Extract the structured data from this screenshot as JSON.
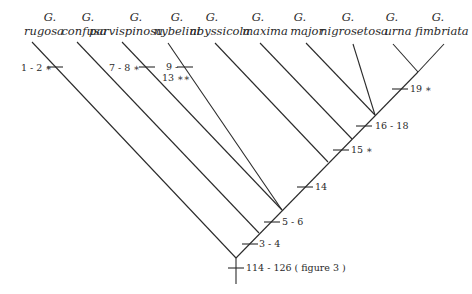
{
  "diagram": {
    "type": "cladogram",
    "taxa": [
      {
        "genus": "G.",
        "species": "rugosa",
        "label_x": 44,
        "tip": [
          32,
          42
        ],
        "joins": [
          236,
          258
        ]
      },
      {
        "genus": "G.",
        "species": "confusa",
        "label_x": 84,
        "tip": [
          77,
          42
        ],
        "joins": [
          259,
          233
        ]
      },
      {
        "genus": "G.",
        "species": "parvispinosa",
        "label_x": 126,
        "tip": [
          122,
          42
        ],
        "joins": [
          282,
          210
        ]
      },
      {
        "genus": "G.",
        "species": "nybelini",
        "label_x": 177,
        "tip": [
          168,
          43
        ],
        "joins": [
          282,
          210
        ]
      },
      {
        "genus": "G.",
        "species": "abyssicola",
        "label_x": 221,
        "tip": [
          215,
          43
        ],
        "joins": [
          328,
          162
        ]
      },
      {
        "genus": "G.",
        "species": "maxima",
        "label_x": 265,
        "tip": [
          260,
          43
        ],
        "joins": [
          352,
          139
        ]
      },
      {
        "genus": "G.",
        "species": "major",
        "label_x": 308,
        "tip": [
          306,
          43
        ],
        "joins": [
          375,
          115
        ]
      },
      {
        "genus": "G.",
        "species": "nigrosetosa",
        "label_x": 357,
        "tip": [
          353,
          44
        ],
        "joins": [
          375,
          115
        ]
      },
      {
        "genus": "G.",
        "species": "urna",
        "label_x": 398,
        "tip": [
          393,
          44
        ],
        "joins": [
          418,
          72
        ]
      },
      {
        "genus": "G.",
        "species": "fimbriata",
        "label_x": 444,
        "tip": [
          444,
          44
        ],
        "joins": [
          418,
          72
        ]
      }
    ],
    "trunk": {
      "from": [
        236,
        258
      ],
      "to": [
        418,
        72
      ]
    },
    "root_stem": {
      "from": [
        236,
        258
      ],
      "to": [
        236,
        283
      ]
    },
    "characters": [
      {
        "id": "c-1-2",
        "label": "1 - 2 ∗",
        "tick_x": 55,
        "tick_y": 67,
        "label_x": 21,
        "label_y": 71,
        "anchor": "start"
      },
      {
        "id": "c-7-8",
        "label": "7 - 8 ∗",
        "tick_x": 147,
        "tick_y": 67,
        "label_x": 109,
        "label_y": 71,
        "anchor": "start"
      },
      {
        "id": "c-9-13-a",
        "label": "9 -",
        "tick_x": 185,
        "tick_y": 67,
        "label_x": 166,
        "label_y": 70,
        "anchor": "start"
      },
      {
        "id": "c-9-13-b",
        "label": "13 ∗∗",
        "tick_x": null,
        "tick_y": null,
        "label_x": 162,
        "label_y": 81,
        "anchor": "start"
      },
      {
        "id": "c-19",
        "label": "19 ∗",
        "tick_x": 400,
        "tick_y": 89,
        "label_x": 410,
        "label_y": 92,
        "anchor": "start"
      },
      {
        "id": "c-16-18",
        "label": "16 - 18",
        "tick_x": 364,
        "tick_y": 126,
        "label_x": 374,
        "label_y": 129,
        "anchor": "start"
      },
      {
        "id": "c-15",
        "label": "15 ∗",
        "tick_x": 341,
        "tick_y": 150,
        "label_x": 351,
        "label_y": 153,
        "anchor": "start"
      },
      {
        "id": "c-14",
        "label": "14",
        "tick_x": 305,
        "tick_y": 187,
        "label_x": 315,
        "label_y": 190,
        "anchor": "start"
      },
      {
        "id": "c-5-6",
        "label": "5 - 6",
        "tick_x": 272,
        "tick_y": 222,
        "label_x": 282,
        "label_y": 225,
        "anchor": "start"
      },
      {
        "id": "c-3-4",
        "label": "3 - 4",
        "tick_x": 250,
        "tick_y": 244,
        "label_x": 259,
        "label_y": 247,
        "anchor": "start"
      },
      {
        "id": "c-114-126",
        "label": "114 - 126 ( figure 3 )",
        "tick_x": 236,
        "tick_y": 268,
        "label_x": 245,
        "label_y": 271,
        "anchor": "start"
      }
    ]
  },
  "labels": {
    "genus": "G.",
    "rugosa": "rugosa",
    "confusa": "confusa",
    "parvispinosa": "parvispinosa",
    "nybelini": "nybelini",
    "abyssicola": "abyssicola",
    "maxima": "maxima",
    "major": "major",
    "nigrosetosa": "nigrosetosa",
    "urna": "urna",
    "fimbriata": "fimbriata",
    "c_1_2": "1 - 2 ∗",
    "c_7_8": "7 - 8 ∗",
    "c_9": "9 -",
    "c_13": "13 ∗∗",
    "c_19": "19 ∗",
    "c_16_18": "16 - 18",
    "c_15": "15 ∗",
    "c_14": "14",
    "c_5_6": "5 - 6",
    "c_3_4": "3 - 4",
    "c_114_126": "114 - 126 ( figure 3 )"
  }
}
